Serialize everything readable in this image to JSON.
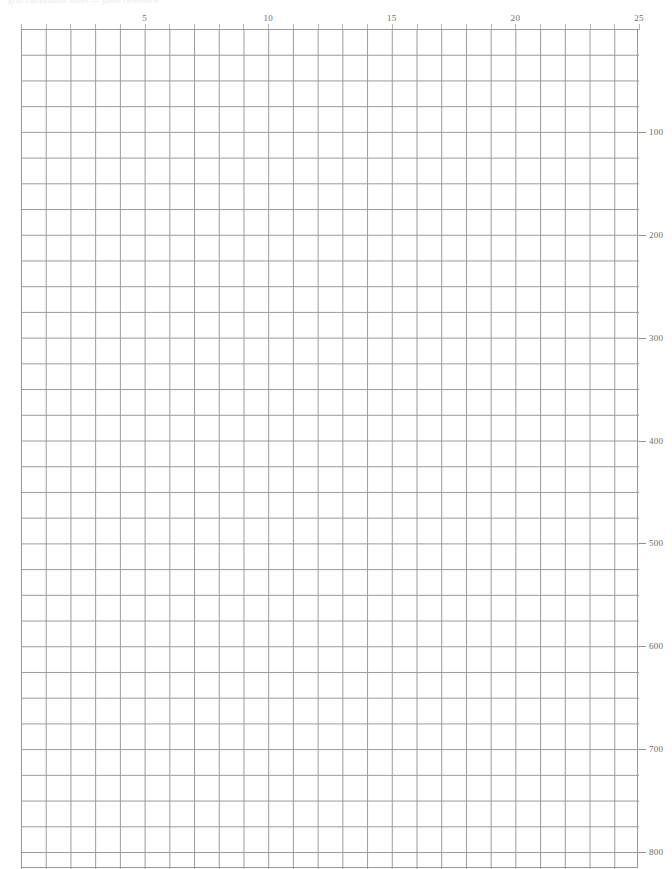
{
  "page": {
    "width": 672,
    "height": 858,
    "background_color": "#ffffff",
    "clipped_header_text": "grid calibration sheet — plate reference"
  },
  "chart_data": {
    "type": "line",
    "title": "",
    "subtitle": "",
    "xlabel": "",
    "ylabel": "",
    "grid": true,
    "legend": null,
    "series": [],
    "x": [],
    "values": [],
    "xlim": [
      0,
      25
    ],
    "ylim": [
      800,
      0
    ],
    "x_axis": {
      "position": "top",
      "min": 0,
      "max": 25,
      "tick_interval": 1,
      "label_interval": 5,
      "tick_labels": [
        "5",
        "10",
        "15",
        "20",
        "25"
      ],
      "tick_label_values": [
        5,
        10,
        15,
        20,
        25
      ],
      "tick_color": "#b4b4b4",
      "label_color": "#6d6d6d"
    },
    "y_axis": {
      "position": "right",
      "min": 0,
      "max": 800,
      "direction": "increasing-downward",
      "tick_interval": 100,
      "tick_labels": [
        "100",
        "200",
        "300",
        "400",
        "500",
        "600",
        "700",
        "800"
      ],
      "tick_label_values": [
        100,
        200,
        300,
        400,
        500,
        600,
        700,
        800
      ],
      "tick_color": "#8e8e8e",
      "label_color": "#6d6d6d"
    },
    "grid_style": {
      "columns": 25,
      "rows": 33,
      "cell_width_px": 24.72,
      "cell_height_px": 25.72,
      "line_color": "#9a9a9a",
      "border_color": "#9a9a9a",
      "units_per_column": 1,
      "units_per_row": 25
    }
  }
}
